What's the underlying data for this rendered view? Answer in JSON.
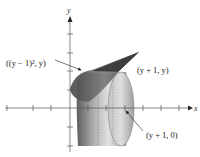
{
  "figure": {
    "type": "solid-of-revolution",
    "axes": {
      "x_label": "x",
      "y_label": "y",
      "origin_px": [
        70,
        108
      ],
      "tick_spacing_px": 18.5,
      "x_ticks_px": [
        7,
        33,
        51,
        88,
        106,
        125,
        143,
        161,
        179
      ],
      "y_ticks_px": [
        34,
        53,
        71,
        90,
        127,
        146
      ]
    },
    "annotations": [
      {
        "id": "left-curve-point",
        "text": "((y − 1)², y)"
      },
      {
        "id": "right-line-point",
        "text": "(y + 1, y)"
      },
      {
        "id": "axis-point",
        "text": "(y + 1, 0)"
      }
    ],
    "colors": {
      "region_dark": "#4a4a4a",
      "solid_light": "#d8d8d8",
      "solid_mid": "#9a9a9a",
      "solid_dark": "#555555",
      "axis": "#555555"
    }
  }
}
